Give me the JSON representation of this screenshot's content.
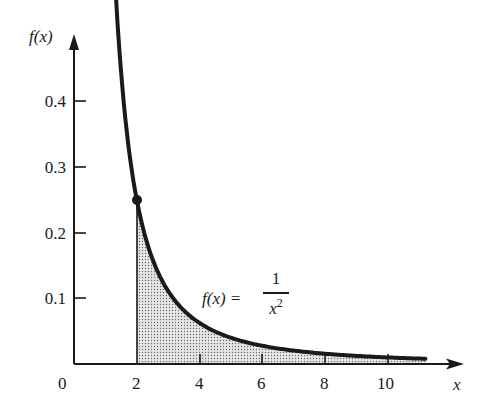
{
  "chart_data": {
    "type": "area",
    "title": "",
    "function": "f(x) = 1/x^2",
    "xlabel": "x",
    "ylabel": "f(x)",
    "x_ticks": [
      0,
      2,
      4,
      6,
      8,
      10
    ],
    "y_ticks": [
      0.1,
      0.2,
      0.3,
      0.4
    ],
    "xlim": [
      0,
      12
    ],
    "ylim": [
      0,
      0.53
    ],
    "grid": false,
    "legend": null,
    "series": [
      {
        "name": "f(x) = 1/x^2",
        "type": "line",
        "x": [
          1.34,
          1.5,
          2,
          2.5,
          3,
          4,
          5,
          6,
          7,
          8,
          9,
          10,
          11.2
        ],
        "values": [
          0.557,
          0.444,
          0.25,
          0.16,
          0.111,
          0.0625,
          0.04,
          0.0278,
          0.0204,
          0.0156,
          0.0123,
          0.01,
          0.008
        ]
      }
    ],
    "shaded_region": {
      "x_from": 2,
      "x_to": 11.2,
      "pattern": "dotted",
      "description": "area under curve for x >= 2"
    },
    "highlighted_point": {
      "x": 2,
      "y": 0.25
    },
    "annotations": [
      {
        "text": "f(x) = 1/x^2",
        "x": 4.3,
        "y": 0.1
      }
    ]
  },
  "labels": {
    "y_axis": "f(x)",
    "x_axis": "x",
    "origin": "0",
    "x_ticks": [
      "2",
      "4",
      "6",
      "8",
      "10"
    ],
    "y_ticks": [
      "0.4",
      "0.3",
      "0.2",
      "0.1"
    ],
    "formula_lhs": "f(x) =",
    "formula_num": "1",
    "formula_den": "x",
    "formula_exp": "2"
  }
}
